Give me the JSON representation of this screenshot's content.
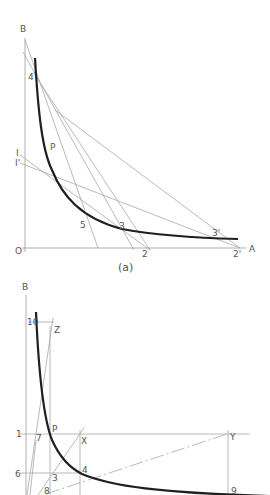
{
  "figure_a": {
    "caption": "(a)",
    "labels": {
      "B": "B",
      "O": "O",
      "A": "A",
      "four": "4",
      "I": "I",
      "I_prime": "I'",
      "P": "P",
      "five": "5",
      "three": "3",
      "three_prime": "3'",
      "two": "2",
      "two_prime": "2'"
    }
  },
  "figure_b": {
    "labels": {
      "B": "B",
      "ten": "10",
      "Z": "Z",
      "one": "1",
      "seven": "7",
      "P": "P",
      "X": "X",
      "Y": "Y",
      "six": "6",
      "three": "3",
      "four": "4",
      "eight": "8",
      "nine": "9"
    }
  },
  "colors": {
    "curve": "#1f1f1f",
    "construction_lines": "#a8a8a8",
    "labels": "#555555",
    "background": "#ffffff"
  }
}
